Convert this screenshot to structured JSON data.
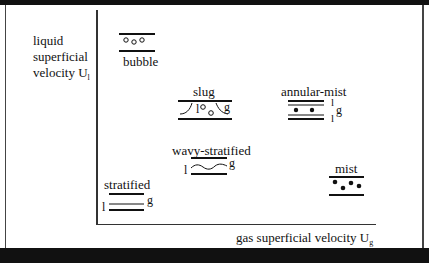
{
  "figure": {
    "y_axis_label": [
      "liquid",
      "superficial",
      "velocity U"
    ],
    "y_axis_subscript": "l",
    "x_axis_label": "gas superficial velocity U",
    "x_axis_subscript": "g"
  },
  "regimes": [
    {
      "name": "bubble",
      "label": "bubble"
    },
    {
      "name": "slug",
      "label": "slug",
      "phase_labels": [
        "l",
        "g"
      ]
    },
    {
      "name": "annular-mist",
      "label": "annular-mist",
      "phase_labels": [
        "l",
        "g",
        "l"
      ]
    },
    {
      "name": "wavy-stratified",
      "label": "wavy-stratified",
      "phase_labels": [
        "l",
        "g"
      ]
    },
    {
      "name": "stratified",
      "label": "stratified",
      "phase_labels": [
        "l",
        "g"
      ]
    },
    {
      "name": "mist",
      "label": "mist"
    }
  ],
  "colors": {
    "line": "#111111",
    "background": "#ffffff",
    "frame": "#111111"
  }
}
